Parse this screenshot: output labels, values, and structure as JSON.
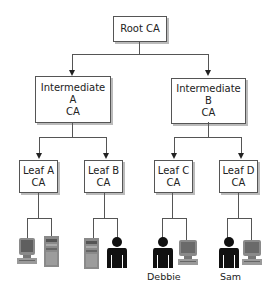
{
  "diagram": {
    "type": "certificate-authority-hierarchy",
    "root": {
      "lines": [
        "Root CA"
      ]
    },
    "intermediates": [
      {
        "id": "A",
        "lines": [
          "Intermediate",
          "A",
          "CA"
        ]
      },
      {
        "id": "B",
        "lines": [
          "Intermediate",
          "B",
          "CA"
        ]
      }
    ],
    "leaves": [
      {
        "id": "A",
        "lines": [
          "Leaf A",
          "CA"
        ],
        "parent": "Intermediate A",
        "children": [
          "computer-icon",
          "server-icon"
        ]
      },
      {
        "id": "B",
        "lines": [
          "Leaf B",
          "CA"
        ],
        "parent": "Intermediate A",
        "children": [
          "server-icon",
          "person-icon"
        ]
      },
      {
        "id": "C",
        "lines": [
          "Leaf C",
          "CA"
        ],
        "parent": "Intermediate B",
        "children": [
          "person-icon",
          "computer-icon"
        ]
      },
      {
        "id": "D",
        "lines": [
          "Leaf D",
          "CA"
        ],
        "parent": "Intermediate B",
        "children": [
          "person-icon",
          "computer-icon"
        ]
      }
    ],
    "end_entity_labels": {
      "debbie": "Debbie",
      "sam": "Sam"
    }
  },
  "colors": {
    "line": "#555555",
    "box_border": "#555555",
    "person": "#111111",
    "device": "#8a8a8a"
  }
}
